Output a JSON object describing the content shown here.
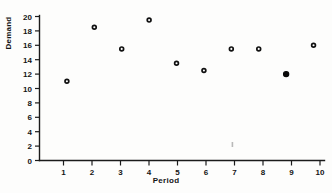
{
  "chart_data": {
    "type": "scatter",
    "title": "",
    "subtitle": "",
    "xlabel": "Period",
    "ylabel": "Demand",
    "x": [
      1,
      2,
      3,
      4,
      5,
      6,
      7,
      8,
      9,
      10
    ],
    "values": [
      11,
      18.5,
      15.5,
      19.5,
      13.5,
      12.5,
      15.5,
      15.5,
      12,
      16
    ],
    "series": [
      {
        "name": "Demand",
        "x": [
          1,
          2,
          3,
          4,
          5,
          6,
          7,
          8,
          9,
          10
        ],
        "values": [
          11,
          18.5,
          15.5,
          19.5,
          13.5,
          12.5,
          15.5,
          15.5,
          12,
          16
        ],
        "marker_styles": [
          "open",
          "open",
          "open",
          "open",
          "open",
          "open",
          "open",
          "open",
          "filled",
          "open"
        ]
      }
    ],
    "xlim": [
      0,
      10.4
    ],
    "ylim": [
      0,
      20
    ],
    "xticks": [
      1,
      2,
      3,
      4,
      5,
      6,
      7,
      8,
      9,
      10
    ],
    "yticks": [
      0,
      2,
      4,
      6,
      8,
      10,
      12,
      14,
      16,
      18,
      20
    ],
    "xtick_labels": [
      "1",
      "2",
      "3",
      "4",
      "5",
      "6",
      "7",
      "8",
      "9",
      "10"
    ],
    "ytick_labels": [
      "0",
      "2",
      "4",
      "6",
      "8",
      "10",
      "12",
      "14",
      "16",
      "18",
      "20"
    ],
    "grid": false,
    "legend": false,
    "legend_position": "none",
    "annotations": [],
    "marker_color": "#111111",
    "axis_color": "#1b1b1b",
    "background_color": "#fdfdfc"
  },
  "figure": {
    "x_axis_title": "Period",
    "y_axis_title": "Demand"
  }
}
